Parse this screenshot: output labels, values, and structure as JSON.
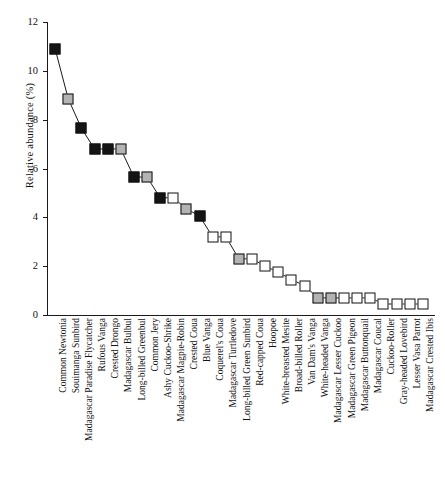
{
  "chart_data": {
    "type": "line",
    "title": "",
    "xlabel": "",
    "ylabel": "Relative abundance (%)",
    "ylim": [
      0,
      12
    ],
    "yticks": [
      0,
      2,
      4,
      6,
      8,
      10,
      12
    ],
    "grid": false,
    "legend": null,
    "marker_fills": {
      "black": "#141414",
      "gray": "#b3b3b3",
      "white": "#ffffff"
    },
    "categories": [
      "Common Newtonia",
      "Souimanga Sunbird",
      "Madagascar Paradise Flycatcher",
      "Rufous Vanga",
      "Crested Drongo",
      "Madagascar Bulbul",
      "Long-billed Greenbul",
      "Common Jery",
      "Ashy Cuckoo-Shrike",
      "Madagascar Magpie-Robin",
      "Crested Coua",
      "Blue Vanga",
      "Coquerel's Coua",
      "Madagascar Turtledove",
      "Long-billed Green Sunbird",
      "Red-capped Coua",
      "Hoopoe",
      "White-breasted Mesite",
      "Broad-billed Roller",
      "Van Dam's Vanga",
      "White-headed Vanga",
      "Madagascar Lesser Cuckoo",
      "Madagascar Green Pigeon",
      "Madagascar Buttonquail",
      "Madagascar Coucal",
      "Cuckoo-Roller",
      "Gray-headed Lovebird",
      "Lesser Vasa Parrot",
      "Madagascar Crested Ibis"
    ],
    "values": [
      10.9,
      8.85,
      7.65,
      6.8,
      6.8,
      6.8,
      5.65,
      5.65,
      4.8,
      4.8,
      4.35,
      4.05,
      3.2,
      3.2,
      2.3,
      2.3,
      2.0,
      1.75,
      1.45,
      1.2,
      0.7,
      0.7,
      0.7,
      0.7,
      0.7,
      0.45,
      0.45,
      0.45,
      0.45
    ],
    "fills": [
      "black",
      "gray",
      "black",
      "black",
      "black",
      "gray",
      "black",
      "gray",
      "black",
      "white",
      "gray",
      "black",
      "white",
      "white",
      "gray",
      "white",
      "white",
      "white",
      "white",
      "white",
      "gray",
      "gray",
      "white",
      "white",
      "white",
      "white",
      "white",
      "white",
      "white"
    ]
  }
}
